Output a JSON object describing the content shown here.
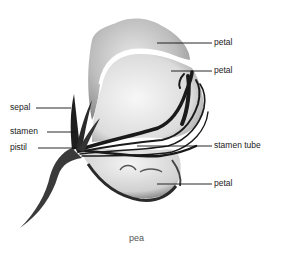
{
  "diagram": {
    "caption": "pea",
    "labels": [
      {
        "id": "petal-top",
        "text": "petal"
      },
      {
        "id": "petal-upper",
        "text": "petal"
      },
      {
        "id": "sepal",
        "text": "sepal"
      },
      {
        "id": "stamen",
        "text": "stamen"
      },
      {
        "id": "pistil",
        "text": "pistil"
      },
      {
        "id": "stamen-tube",
        "text": "stamen tube"
      },
      {
        "id": "petal-lower",
        "text": "petal"
      }
    ]
  }
}
